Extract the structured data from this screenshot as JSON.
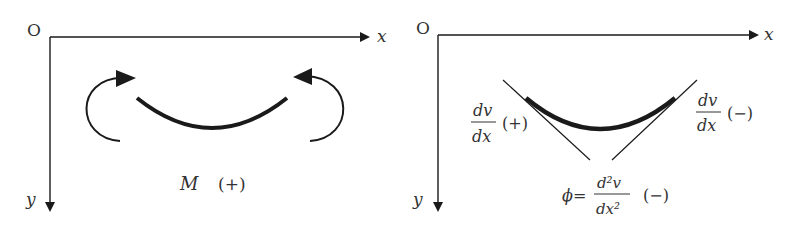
{
  "left_panel": {
    "origin_label": "O",
    "x_axis_label": "x",
    "y_axis_label": "y",
    "moment_label": "M",
    "moment_sign": "(+)"
  },
  "right_panel": {
    "origin_label": "O",
    "x_axis_label": "x",
    "y_axis_label": "y",
    "left_slope": {
      "num": "dv",
      "den": "dx",
      "sign": "(+)"
    },
    "right_slope": {
      "num": "dv",
      "den": "dx",
      "sign": "(−)"
    },
    "curvature": {
      "prefix": "ϕ=",
      "num": "d²v",
      "den": "dx²",
      "sign": "(−)"
    }
  },
  "colors": {
    "stroke": "#1a1a1a",
    "text": "#333333",
    "background": "#ffffff"
  }
}
